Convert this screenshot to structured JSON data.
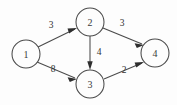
{
  "diagram": {
    "type": "directed-weighted-graph",
    "background_color": "#fdfdfd",
    "stroke_color": "#4a4a4a",
    "text_color": "#333333",
    "nodes": [
      {
        "id": "1",
        "label": "1",
        "cx": 26,
        "cy": 54,
        "r": 14
      },
      {
        "id": "2",
        "label": "2",
        "cx": 90,
        "cy": 22,
        "r": 14
      },
      {
        "id": "3",
        "label": "3",
        "cx": 90,
        "cy": 84,
        "r": 14
      },
      {
        "id": "4",
        "label": "4",
        "cx": 155,
        "cy": 53,
        "r": 14
      }
    ],
    "edges": [
      {
        "id": "e12",
        "from": "1",
        "to": "2",
        "weight": "3",
        "directed": true,
        "x1": 38,
        "y1": 47,
        "x2": 77,
        "y2": 28,
        "label_x": 51,
        "label_y": 25
      },
      {
        "id": "e13",
        "from": "1",
        "to": "3",
        "weight": "8",
        "directed": true,
        "x1": 37,
        "y1": 62,
        "x2": 77,
        "y2": 79,
        "label_x": 53,
        "label_y": 69
      },
      {
        "id": "e23",
        "from": "2",
        "to": "3",
        "weight": "4",
        "directed": true,
        "x1": 90,
        "y1": 36,
        "x2": 90,
        "y2": 70,
        "label_x": 99,
        "label_y": 52
      },
      {
        "id": "e24",
        "from": "2",
        "to": "4",
        "weight": "3",
        "directed": true,
        "x1": 103,
        "y1": 28,
        "x2": 144,
        "y2": 45,
        "label_x": 122,
        "label_y": 23
      },
      {
        "id": "e34",
        "from": "3",
        "to": "4",
        "weight": "2",
        "directed": true,
        "x1": 104,
        "y1": 79,
        "x2": 144,
        "y2": 62,
        "label_x": 124,
        "label_y": 70
      }
    ]
  }
}
